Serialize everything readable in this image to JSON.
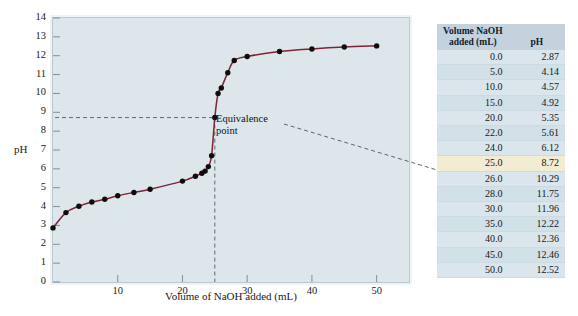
{
  "chart_data": {
    "type": "line",
    "title": "",
    "xlabel": "Volume of NaOH added (mL)",
    "ylabel": "pH",
    "xlim": [
      0,
      55
    ],
    "ylim": [
      0,
      14
    ],
    "grid": false,
    "legend": "none",
    "xticks": [
      "10",
      "20",
      "30",
      "40",
      "50"
    ],
    "xtick_values": [
      10,
      20,
      30,
      40,
      50
    ],
    "yticks": [
      "0",
      "1",
      "2",
      "3",
      "4",
      "5",
      "6",
      "7",
      "8",
      "9",
      "10",
      "11",
      "12",
      "13",
      "14"
    ],
    "ytick_values": [
      0,
      1,
      2,
      3,
      4,
      5,
      6,
      7,
      8,
      9,
      10,
      11,
      12,
      13,
      14
    ],
    "series": [
      {
        "name": "Titration of weak acid with NaOH",
        "color": "#7d2436",
        "x": [
          0.0,
          2.0,
          4.0,
          6.0,
          8.0,
          10.0,
          12.5,
          15.0,
          20.0,
          22.0,
          23.0,
          23.5,
          24.0,
          24.5,
          25.0,
          25.5,
          26.0,
          27.0,
          28.0,
          30.0,
          35.0,
          40.0,
          45.0,
          50.0
        ],
        "y": [
          2.87,
          3.68,
          4.02,
          4.24,
          4.39,
          4.57,
          4.75,
          4.92,
          5.35,
          5.61,
          5.77,
          5.88,
          6.12,
          6.7,
          8.72,
          10.0,
          10.29,
          11.1,
          11.75,
          11.96,
          12.22,
          12.36,
          12.46,
          12.52
        ]
      }
    ],
    "annotations": [
      {
        "text_line1": "Equivalence",
        "text_line2": "point",
        "x": 25.0,
        "y": 8.72,
        "guide_horizontal_y": 8.72,
        "guide_vertical_x": 25.0
      }
    ],
    "table": {
      "headers": [
        "Volume NaOH added (mL)",
        "pH"
      ],
      "header_line1": "Volume NaOH",
      "header_line2": "added (mL)",
      "header_ph": "pH",
      "highlight_row_index": 7,
      "rows": [
        {
          "volume": "0.0",
          "ph": "2.87"
        },
        {
          "volume": "5.0",
          "ph": "4.14"
        },
        {
          "volume": "10.0",
          "ph": "4.57"
        },
        {
          "volume": "15.0",
          "ph": "4.92"
        },
        {
          "volume": "20.0",
          "ph": "5.35"
        },
        {
          "volume": "22.0",
          "ph": "5.61"
        },
        {
          "volume": "24.0",
          "ph": "6.12"
        },
        {
          "volume": "25.0",
          "ph": "8.72"
        },
        {
          "volume": "26.0",
          "ph": "10.29"
        },
        {
          "volume": "28.0",
          "ph": "11.75"
        },
        {
          "volume": "30.0",
          "ph": "11.96"
        },
        {
          "volume": "35.0",
          "ph": "12.22"
        },
        {
          "volume": "40.0",
          "ph": "12.36"
        },
        {
          "volume": "45.0",
          "ph": "12.46"
        },
        {
          "volume": "50.0",
          "ph": "12.52"
        }
      ]
    }
  },
  "colors": {
    "curve": "#7d2436",
    "plot_background": "#dde6eb",
    "plot_border": "#b9c8d1",
    "table_header": "#c3d2dc",
    "table_row": "#dbe6ec",
    "table_row_alt": "#d2e0e8",
    "table_highlight": "#f3ecd4",
    "marker": "#0d0d0d",
    "guide_line": "#5f6a72"
  }
}
